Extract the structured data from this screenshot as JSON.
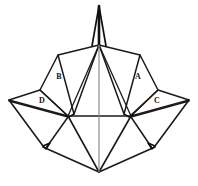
{
  "figure": {
    "background_color": "#ffffff",
    "line_color": "#1a1a1a",
    "center_line_color": "#8a8a8a",
    "width": 198,
    "height": 186,
    "labels": [
      {
        "id": "label-a",
        "text": "A",
        "x": 138,
        "y": 77
      },
      {
        "id": "label-b",
        "text": "B",
        "x": 59,
        "y": 77
      },
      {
        "id": "label-c",
        "text": "C",
        "x": 157,
        "y": 101
      },
      {
        "id": "label-d",
        "text": "D",
        "x": 42,
        "y": 101
      }
    ],
    "key_points": {
      "apex_tip": "99,6",
      "apex_junction": "99,45",
      "left_tip": "9,100",
      "right_tip": "189,100",
      "left_waist": "68,116",
      "right_waist": "131,116",
      "left_foot": "43,146",
      "right_foot": "155,146",
      "bottom_vertex": "99,172"
    },
    "paths": {
      "spike_left": "M 99 6 L 92 46",
      "spike_right": "M 99 6 L 106 46",
      "spike_core": "M 99 6 L 99 45",
      "center_axis": "M 99 45 L 99 172",
      "apex_to_b_top": "M 99 45 L 58 55",
      "apex_to_a_top": "M 99 45 L 140 55",
      "apex_to_b_bottom": "M 99 45 L 74 114",
      "apex_to_a_bottom": "M 99 45 L 124 114",
      "apex_to_left_waist": "M 99 45 L 68 116",
      "apex_to_right_waist": "M 99 45 L 131 116",
      "panel_b": "M 58 55 L 40 90 L 69 117 L 74 114 Z",
      "panel_a": "M 140 55 L 158 90 L 129 117 L 124 114 Z",
      "panel_d": "M 40 90 L 9 100 L 68 116 Z",
      "panel_c": "M 158 90 L 189 100 L 131 116 Z",
      "waist_bar": "M 68 116 L 131 116",
      "left_wing_outer": "M 9 100 L 43 146",
      "left_wing_inner": "M 9 101 L 68 117",
      "left_foot_notch": "M 43 146 L 50 143 L 46 149 Z",
      "left_foot_to_bottom": "M 43 147 L 99 172",
      "left_waist_to_bottom": "M 68 116 L 99 172",
      "left_waist_to_foot": "M 68 117 L 46 148",
      "right_wing_outer": "M 189 100 L 155 146",
      "right_wing_inner": "M 189 101 L 131 117",
      "right_foot_notch": "M 155 146 L 148 143 L 152 149 Z",
      "right_foot_to_bottom": "M 155 147 L 99 172",
      "right_waist_to_bottom": "M 131 116 L 99 172",
      "right_waist_to_foot": "M 131 117 L 152 148"
    }
  }
}
